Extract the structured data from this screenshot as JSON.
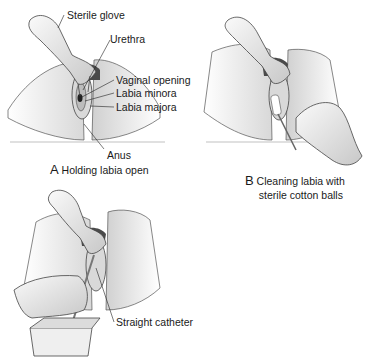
{
  "panels": [
    {
      "id": "A",
      "letter": "A",
      "caption": "Holding labia open",
      "labels": [
        {
          "text": "Sterile glove"
        },
        {
          "text": "Urethra"
        },
        {
          "text": "Vaginal opening"
        },
        {
          "text": "Labia minora"
        },
        {
          "text": "Labia majora"
        },
        {
          "text": "Anus"
        }
      ]
    },
    {
      "id": "B",
      "letter": "B",
      "caption_line1": "Cleaning labia with",
      "caption_line2": "sterile cotton balls"
    },
    {
      "id": "C",
      "labels": [
        {
          "text": "Straight catheter"
        }
      ]
    }
  ],
  "colors": {
    "line": "#333333",
    "shade": "#bdbdbd",
    "skin": "#f2f2f2",
    "glove": "#e6e6e6"
  }
}
